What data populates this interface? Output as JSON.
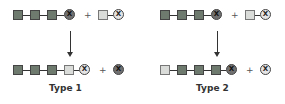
{
  "diagram": {
    "symbol_label": "X",
    "plus": "+",
    "colors": {
      "dark_unit": "#6f7a6f",
      "light_unit": "#d9dcd9",
      "dark_x": "#707070",
      "light_x": "#e4e4e4"
    },
    "type1": {
      "label": "Type 1",
      "reactant_chain": [
        "dark",
        "dark",
        "dark",
        "X-dark"
      ],
      "reactant_partner": [
        "light",
        "X-light"
      ],
      "product_chain": [
        "dark",
        "dark",
        "dark",
        "light",
        "X-light"
      ],
      "product_partner": [
        "X-dark"
      ]
    },
    "type2": {
      "label": "Type 2",
      "reactant_chain": [
        "dark",
        "dark",
        "dark",
        "X-dark"
      ],
      "reactant_partner": [
        "light",
        "X-light"
      ],
      "product_chain": [
        "light",
        "dark",
        "dark",
        "dark",
        "X-dark"
      ],
      "product_partner": [
        "X-light"
      ]
    }
  }
}
